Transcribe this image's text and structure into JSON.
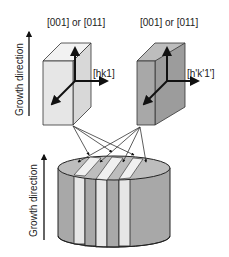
{
  "diagram": {
    "top_left_crystal": {
      "top_label": "[001] or [011]",
      "side_label": "[hk1]",
      "face_color": "#e6e6e6"
    },
    "top_right_crystal": {
      "top_label": "[001] or [011]",
      "side_label": "[h'k'1']",
      "face_color": "#a8a8a8"
    },
    "top_axis_label": "Growth direction",
    "bottom_axis_label": "Growth direction",
    "cylinder": {
      "light_stripe_color": "#e6e6e6",
      "dark_stripe_color": "#a8a8a8",
      "stripe_count": 7
    },
    "colors": {
      "stroke": "#222222",
      "background": "#ffffff"
    }
  }
}
